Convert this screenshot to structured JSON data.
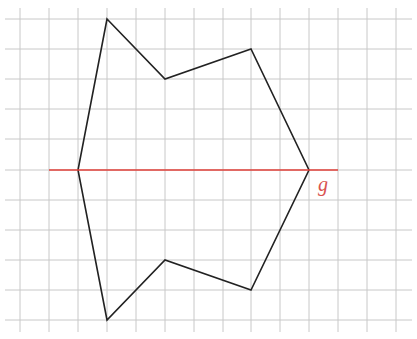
{
  "diagram": {
    "type": "grid-polygon-reflection",
    "grid": {
      "x_lines": [
        20,
        49,
        78,
        107,
        136,
        165,
        194,
        223,
        251,
        280,
        309,
        338,
        367,
        396
      ],
      "y_lines": [
        19,
        49,
        79,
        109,
        139,
        170,
        200,
        230,
        260,
        290,
        320
      ],
      "x_extent": [
        5,
        412
      ],
      "y_extent": [
        8,
        332
      ],
      "color": "#c8c8c8"
    },
    "polygon": {
      "points": [
        [
          107,
          19
        ],
        [
          165,
          79
        ],
        [
          251,
          49
        ],
        [
          309,
          170
        ],
        [
          251,
          290
        ],
        [
          165,
          260
        ],
        [
          107,
          320
        ],
        [
          78,
          170
        ]
      ],
      "stroke": "#222222"
    },
    "axis_line": {
      "name": "g",
      "x1": 49,
      "x2": 338,
      "y": 170,
      "color": "#e0413a"
    },
    "label": {
      "text": "g",
      "x": 318,
      "y": 191,
      "color": "#d9534f"
    }
  }
}
